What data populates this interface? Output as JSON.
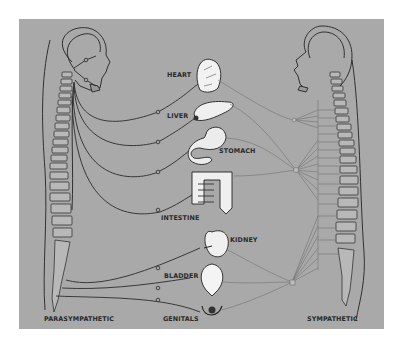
{
  "figure": {
    "background_color": "#a9a9a9",
    "line_color_parasympathetic": "#2b2b2b",
    "line_color_sympathetic": "#7a7a7a"
  },
  "divisions": {
    "left": "PARASYMPATHETIC",
    "right": "SYMPATHETIC"
  },
  "organs": [
    {
      "id": "heart",
      "label": "HEART"
    },
    {
      "id": "liver",
      "label": "LIVER"
    },
    {
      "id": "stomach",
      "label": "STOMACH"
    },
    {
      "id": "intestine",
      "label": "INTESTINE"
    },
    {
      "id": "kidney",
      "label": "KIDNEY"
    },
    {
      "id": "bladder",
      "label": "BLADDER"
    },
    {
      "id": "genitals",
      "label": "GENITALS"
    }
  ]
}
